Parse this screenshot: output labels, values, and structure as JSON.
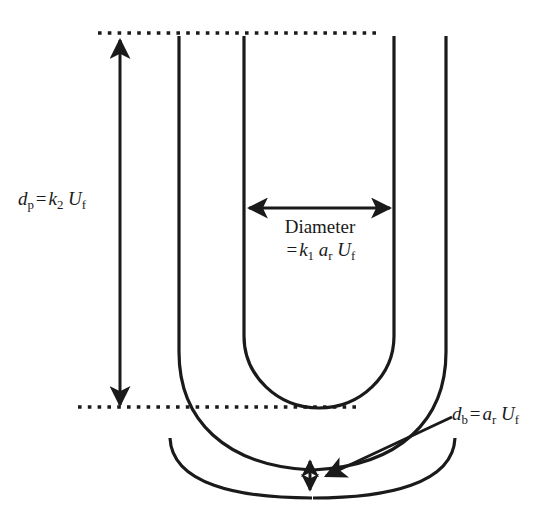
{
  "figure": {
    "type": "technical-diagram",
    "stroke_color": "#1a1a1a",
    "background_color": "#ffffff"
  },
  "labels": {
    "dp": {
      "symbol": "d",
      "symbol_sub": "p",
      "operator": "=",
      "rhs_symbol": "k",
      "rhs_sub": "2",
      "factor_symbol": "U",
      "factor_sub": "f",
      "plain": "d_p = k_2 U_f"
    },
    "diameter": {
      "title": "Diameter",
      "operator": "=",
      "term1_symbol": "k",
      "term1_sub": "1",
      "term2_symbol": "a",
      "term2_sub": "r",
      "term3_symbol": "U",
      "term3_sub": "f",
      "plain": "Diameter = k_1 a_r U_f"
    },
    "db": {
      "symbol": "d",
      "symbol_sub": "b",
      "operator": "=",
      "rhs_symbol": "a",
      "rhs_sub": "r",
      "factor_symbol": "U",
      "factor_sub": "f",
      "plain": "d_b = a_r U_f"
    }
  },
  "geometry": {
    "top_dotted_line": {
      "x1": 98,
      "x2": 380,
      "y": 33
    },
    "bottom_dotted_line": {
      "x1": 78,
      "x2": 361,
      "y": 407
    },
    "vertical_dimension_arrow": {
      "x": 120,
      "y_top": 36,
      "y_bottom": 407
    },
    "horizontal_diameter_arrow": {
      "y": 208,
      "x_left": 247,
      "x_right": 392
    },
    "small_gap_arrow": {
      "x": 310,
      "y_top": 459,
      "y_bottom": 492
    },
    "inner_tube_walls": {
      "left_x": 244,
      "right_x": 394,
      "y_top": 36
    },
    "outer_tube_walls": {
      "left_x": 179,
      "right_x": 446,
      "y_top": 36
    },
    "inner_u_bottom_y": 406,
    "outer_u_bottom_y": 470,
    "lower_bowl_bottom_y": 498,
    "leader_line": {
      "x_start": 452,
      "y_start": 417,
      "x_end": 323,
      "y_end": 476
    }
  }
}
